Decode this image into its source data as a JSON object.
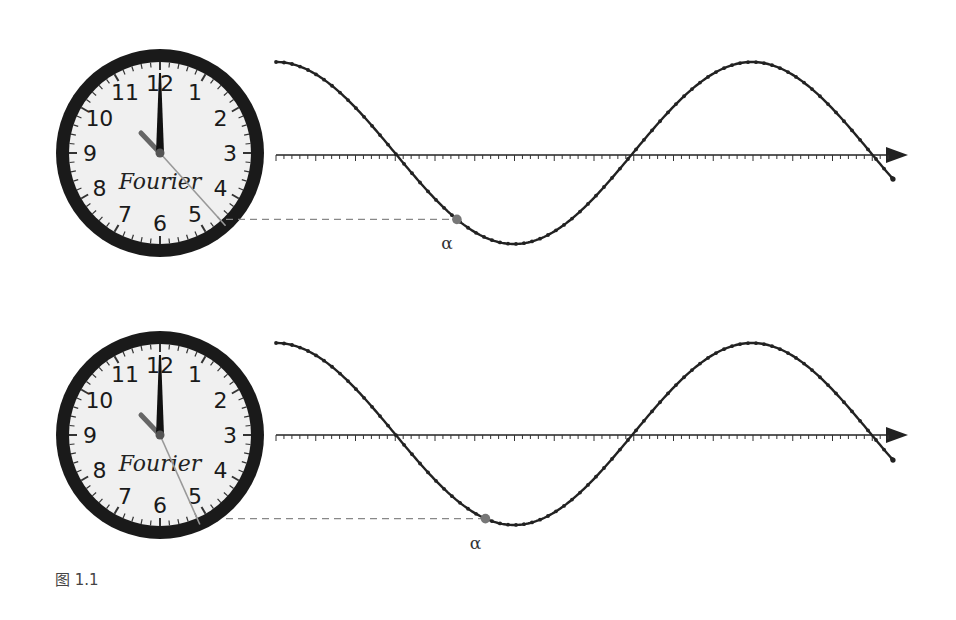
{
  "figure": {
    "caption": "图 1.1",
    "panels": [
      {
        "clock": {
          "brand": "Fourier",
          "numerals": [
            "12",
            "1",
            "2",
            "3",
            "4",
            "5",
            "6",
            "7",
            "8",
            "9",
            "10",
            "11"
          ],
          "time_hour_hand_minutes": 0,
          "second_hand_seconds": 23
        },
        "marker_label": "α",
        "marker_phase_fraction": 0.38
      },
      {
        "clock": {
          "brand": "Fourier",
          "numerals": [
            "12",
            "1",
            "2",
            "3",
            "4",
            "5",
            "6",
            "7",
            "8",
            "9",
            "10",
            "11"
          ],
          "time_hour_hand_minutes": 0,
          "second_hand_seconds": 26
        },
        "marker_label": "α",
        "marker_phase_fraction": 0.44
      }
    ]
  },
  "colors": {
    "curve": "#222222",
    "marker": "#777777",
    "dashed": "#888888",
    "clock_rim": "#1a1a1a",
    "clock_face": "#f0f0f0"
  },
  "chart_data": [
    {
      "type": "line",
      "title": "",
      "xlabel": "",
      "ylabel": "",
      "function": "cos",
      "x_cycles": 1.3,
      "ylim": [
        -1,
        1
      ],
      "marker": {
        "label": "α",
        "x_fraction_of_cycle": 0.38,
        "y": -0.74
      }
    },
    {
      "type": "line",
      "title": "",
      "xlabel": "",
      "ylabel": "",
      "function": "cos",
      "x_cycles": 1.3,
      "ylim": [
        -1,
        1
      ],
      "marker": {
        "label": "α",
        "x_fraction_of_cycle": 0.44,
        "y": -0.94
      }
    }
  ]
}
